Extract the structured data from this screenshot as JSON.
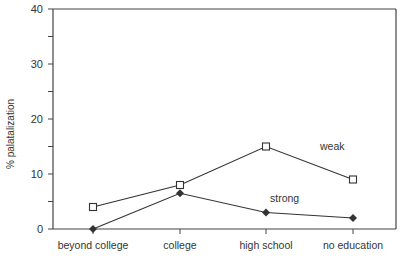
{
  "chart_data": {
    "type": "line",
    "title": "",
    "xlabel": "",
    "ylabel": "% palatalization",
    "ylim": [
      0,
      40
    ],
    "yticks": [
      0,
      10,
      20,
      30,
      40
    ],
    "categories": [
      "beyond college",
      "college",
      "high school",
      "no education"
    ],
    "series": [
      {
        "name": "weak",
        "marker": "open-square",
        "values": [
          4,
          8,
          15,
          9
        ]
      },
      {
        "name": "strong",
        "marker": "filled-diamond",
        "values": [
          0,
          6.5,
          3,
          2
        ]
      }
    ],
    "annotations": [
      {
        "text": "weak",
        "near": "high school-no education, weak series"
      },
      {
        "text": "strong",
        "near": "high school, strong series"
      }
    ],
    "grid": false,
    "legend": "inline labels"
  },
  "colors": {
    "line": "#333333",
    "axis": "#444444",
    "background": "#ffffff"
  }
}
